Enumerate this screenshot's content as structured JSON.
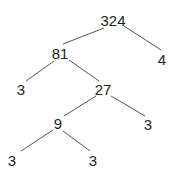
{
  "diagram": {
    "type": "factor-tree",
    "line_color": "#555555",
    "nodes": [
      {
        "id": "n324",
        "label": "324",
        "x": 113,
        "y": 20
      },
      {
        "id": "n81",
        "label": "81",
        "x": 60,
        "y": 53
      },
      {
        "id": "n4",
        "label": "4",
        "x": 162,
        "y": 59
      },
      {
        "id": "n3a",
        "label": "3",
        "x": 21,
        "y": 89
      },
      {
        "id": "n27",
        "label": "27",
        "x": 103,
        "y": 89
      },
      {
        "id": "n9",
        "label": "9",
        "x": 58,
        "y": 123
      },
      {
        "id": "n3b",
        "label": "3",
        "x": 148,
        "y": 124
      },
      {
        "id": "n3c",
        "label": "3",
        "x": 12,
        "y": 160
      },
      {
        "id": "n3d",
        "label": "3",
        "x": 93,
        "y": 160
      }
    ],
    "edges": [
      {
        "x1": 104,
        "y1": 28,
        "x2": 63,
        "y2": 44
      },
      {
        "x1": 124,
        "y1": 26,
        "x2": 161,
        "y2": 50
      },
      {
        "x1": 54,
        "y1": 61,
        "x2": 26,
        "y2": 81
      },
      {
        "x1": 69,
        "y1": 60,
        "x2": 99,
        "y2": 81
      },
      {
        "x1": 96,
        "y1": 96,
        "x2": 64,
        "y2": 116
      },
      {
        "x1": 111,
        "y1": 96,
        "x2": 145,
        "y2": 116
      },
      {
        "x1": 53,
        "y1": 130,
        "x2": 21,
        "y2": 151
      },
      {
        "x1": 63,
        "y1": 131,
        "x2": 90,
        "y2": 151
      }
    ]
  }
}
